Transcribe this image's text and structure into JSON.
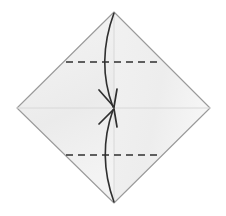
{
  "figure": {
    "canvas": {
      "width": 226,
      "height": 216,
      "background": "#ffffff"
    },
    "paper": {
      "name": "square-sheet-rotated",
      "shape": "diamond",
      "vertices": {
        "top": [
          114,
          12
        ],
        "right": [
          210,
          108
        ],
        "bottom": [
          114,
          203
        ],
        "left": [
          17,
          108
        ]
      },
      "fill_color": "#f2f2f2",
      "fill_color_alt": "#ebebeb",
      "edge_color": "#9a9a9a",
      "edge_width": 1.1
    },
    "center_point": [
      114,
      108
    ],
    "creases": [
      {
        "name": "horizontal-center-crease",
        "style": "solid-faint",
        "color": "#d8d8d8",
        "from": [
          17,
          108
        ],
        "to": [
          210,
          108
        ]
      },
      {
        "name": "vertical-center-crease",
        "style": "solid-faint",
        "color": "#d8d8d8",
        "from": [
          114,
          12
        ],
        "to": [
          114,
          203
        ]
      }
    ],
    "fold_lines": [
      {
        "name": "upper-valley-fold",
        "style": "dashed",
        "color": "#2f2f2f",
        "width": 1.6,
        "dash": "7,5",
        "from": [
          66,
          62
        ],
        "to": [
          162,
          62
        ]
      },
      {
        "name": "lower-valley-fold",
        "style": "dashed",
        "color": "#2f2f2f",
        "width": 1.6,
        "dash": "7,5",
        "from": [
          66,
          155
        ],
        "to": [
          162,
          155
        ]
      }
    ],
    "arrows": [
      {
        "name": "top-fold-arrow",
        "direction": "top-to-center",
        "color": "#2f2f2f",
        "width": 1.6,
        "start": [
          114,
          13
        ],
        "control": [
          96,
          62
        ],
        "end": [
          113,
          107
        ],
        "head_at": [
          113,
          107
        ]
      },
      {
        "name": "bottom-fold-arrow",
        "direction": "bottom-to-center",
        "color": "#2f2f2f",
        "width": 1.6,
        "start": [
          114,
          202
        ],
        "control": [
          97,
          155
        ],
        "end": [
          113,
          110
        ],
        "head_at": [
          113,
          110
        ]
      }
    ],
    "labels": {
      "caption": "",
      "step_number": ""
    }
  }
}
